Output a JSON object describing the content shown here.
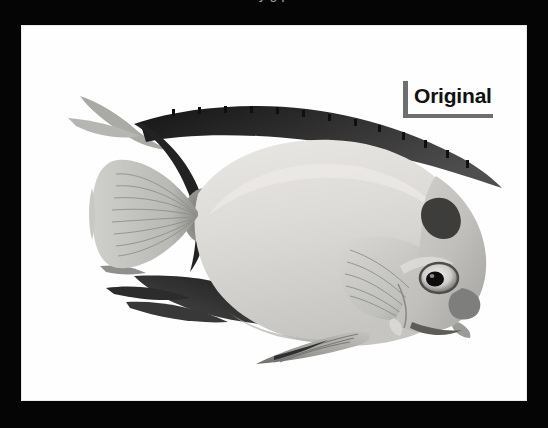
{
  "slide": {
    "background_color": "#050505",
    "clipped_title": "y g p"
  },
  "image_panel": {
    "background_color": "#fefefe",
    "subject": "fish",
    "style": "grayscale-illustration"
  },
  "annotation": {
    "label": "Original",
    "bracket_color": "#6e6e6e",
    "text_color": "#111111"
  },
  "fish": {
    "name": "angelfish",
    "parts": [
      {
        "name": "dorsal-fin",
        "tone": "#2e2e2e"
      },
      {
        "name": "body",
        "tone": "#d8d8d6"
      },
      {
        "name": "caudal-fin",
        "tone": "#b7b7b5"
      },
      {
        "name": "caudal-peduncle",
        "tone": "#8a8a88"
      },
      {
        "name": "pectoral-fin",
        "tone": "#c9c9c7"
      },
      {
        "name": "anal-fin",
        "tone": "#a9a9a7"
      },
      {
        "name": "head",
        "tone": "#c4c4c2"
      },
      {
        "name": "eye",
        "tone": "#101010"
      },
      {
        "name": "snout",
        "tone": "#9a9a98"
      },
      {
        "name": "nape-patch",
        "tone": "#4a4a4a"
      },
      {
        "name": "lower-trailing-fins",
        "tone": "#3a3a3a"
      }
    ],
    "palette": {
      "darkest": "#1d1d1d",
      "dark": "#4a4a4a",
      "mid": "#8d8d8b",
      "light": "#cfcfcd",
      "lightest": "#eceae8"
    }
  }
}
